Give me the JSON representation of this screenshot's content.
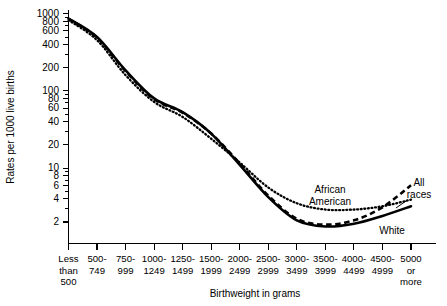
{
  "chart_data": {
    "type": "line",
    "title": "",
    "xlabel": "Birthweight in grams",
    "ylabel": "Rates per 1000 live births",
    "yscale": "log",
    "ylim": [
      1.6,
      1150
    ],
    "grid": false,
    "legend_position": "inline-annotations",
    "categories": [
      "Less than 500",
      "500-749",
      "750-999",
      "1000-1249",
      "1250-1499",
      "1500-1999",
      "2000-2499",
      "2500-2999",
      "3000-3499",
      "3500-3999",
      "4000-4499",
      "4500-4999",
      "5000 or more"
    ],
    "ytick_labels": [
      "1000",
      "800",
      "600",
      "400",
      "200",
      "100",
      "80",
      "60",
      "40",
      "20",
      "10",
      "8",
      "6",
      "4",
      "2"
    ],
    "ytick_values": [
      1000,
      800,
      600,
      400,
      200,
      100,
      80,
      60,
      40,
      20,
      10,
      8,
      6,
      4,
      2
    ],
    "series": [
      {
        "name": "All races",
        "style": "dashed",
        "values": [
          860,
          490,
          180,
          78,
          52,
          28,
          11.5,
          4.4,
          2.2,
          1.85,
          2.1,
          3.1,
          6.0
        ]
      },
      {
        "name": "White",
        "style": "solid",
        "values": [
          870,
          500,
          185,
          80,
          53,
          28,
          11.0,
          4.2,
          2.1,
          1.75,
          1.9,
          2.4,
          3.2
        ]
      },
      {
        "name": "African American",
        "style": "dotted",
        "values": [
          830,
          455,
          160,
          72,
          46,
          24,
          11.8,
          5.6,
          3.5,
          2.9,
          2.9,
          3.2,
          3.9
        ]
      }
    ],
    "annotations": [
      {
        "text_line1": "African",
        "text_line2": "American",
        "series": "African American"
      },
      {
        "text_line1": "All",
        "text_line2": "races",
        "series": "All races"
      },
      {
        "text_line1": "White",
        "text_line2": "",
        "series": "White"
      }
    ]
  },
  "xtick_labels": [
    {
      "line1": "Less",
      "line2": "than",
      "line3": "500"
    },
    {
      "line1": "500-",
      "line2": "749",
      "line3": ""
    },
    {
      "line1": "750-",
      "line2": "999",
      "line3": ""
    },
    {
      "line1": "1000-",
      "line2": "1249",
      "line3": ""
    },
    {
      "line1": "1250-",
      "line2": "1499",
      "line3": ""
    },
    {
      "line1": "1500-",
      "line2": "1999",
      "line3": ""
    },
    {
      "line1": "2000-",
      "line2": "2499",
      "line3": ""
    },
    {
      "line1": "2500-",
      "line2": "2999",
      "line3": ""
    },
    {
      "line1": "3000-",
      "line2": "3499",
      "line3": ""
    },
    {
      "line1": "3500-",
      "line2": "3999",
      "line3": ""
    },
    {
      "line1": "4000-",
      "line2": "4499",
      "line3": ""
    },
    {
      "line1": "4500-",
      "line2": "4999",
      "line3": ""
    },
    {
      "line1": "5000",
      "line2": "or",
      "line3": "more"
    }
  ]
}
